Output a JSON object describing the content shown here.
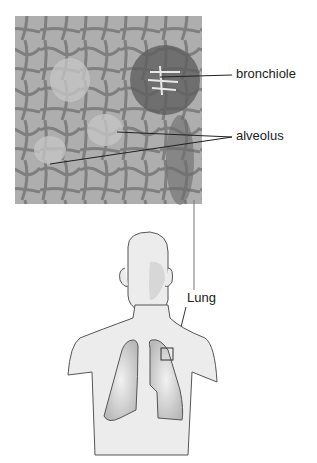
{
  "diagram": {
    "labels": {
      "bronchiole": "bronchiole",
      "alveolus": "alveolus",
      "lung": "Lung"
    },
    "colors": {
      "micrograph_bg": "#a8a8a8",
      "tissue_dark": "#5a5a5a",
      "body_fill": "#ececec",
      "body_stroke": "#555555",
      "lung_fill": "#c8c8c8",
      "line": "#222222"
    }
  }
}
